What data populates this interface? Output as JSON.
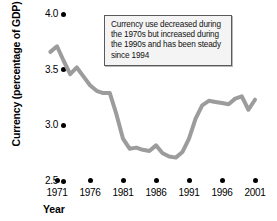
{
  "chart_data": {
    "type": "line",
    "title": "",
    "xlabel": "Year",
    "ylabel": "Currency (percentage of GDP)",
    "xlim": [
      1970,
      2001
    ],
    "ylim": [
      2.5,
      4.0
    ],
    "grid": false,
    "legend": null,
    "line_color": "#9c9c9c",
    "x_ticks": [
      "1971",
      "1976",
      "1981",
      "1986",
      "1991",
      "1996",
      "2001"
    ],
    "x_tick_values": [
      1971,
      1976,
      1981,
      1986,
      1991,
      1996,
      2001
    ],
    "y_ticks": [
      "2.5",
      "3.0",
      "3.5",
      "4.0"
    ],
    "y_tick_values": [
      2.5,
      3.0,
      3.5,
      4.0
    ],
    "x": [
      1970,
      1971,
      1972,
      1973,
      1974,
      1975,
      1976,
      1977,
      1978,
      1979,
      1980,
      1981,
      1982,
      1983,
      1984,
      1985,
      1986,
      1987,
      1988,
      1989,
      1990,
      1991,
      1992,
      1993,
      1994,
      1995,
      1996,
      1997,
      1998,
      1999,
      2000,
      2001
    ],
    "values": [
      3.66,
      3.71,
      3.58,
      3.46,
      3.52,
      3.44,
      3.36,
      3.31,
      3.29,
      3.29,
      3.1,
      2.88,
      2.79,
      2.8,
      2.78,
      2.77,
      2.82,
      2.75,
      2.72,
      2.71,
      2.76,
      2.88,
      3.06,
      3.18,
      3.22,
      3.21,
      3.2,
      3.19,
      3.24,
      3.26,
      3.14,
      3.23
    ],
    "annotation": "Currency use decreased during the 1970s but increased during the 1990s and has been steady since 1994"
  }
}
